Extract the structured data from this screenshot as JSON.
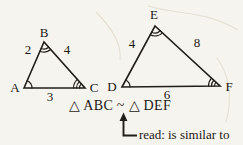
{
  "diagram": {
    "triangle_abc": {
      "vertex_a": "A",
      "vertex_b": "B",
      "vertex_c": "C",
      "side_ab": "2",
      "side_bc": "4",
      "side_ac": "3",
      "angle_marks": {
        "a": 1,
        "b": 2,
        "c": 3
      }
    },
    "triangle_def": {
      "vertex_d": "D",
      "vertex_e": "E",
      "vertex_f": "F",
      "side_de": "4",
      "side_ef": "8",
      "side_df": "6",
      "angle_marks": {
        "d": 1,
        "e": 2,
        "f": 3
      }
    },
    "similarity_statement": "△ ABC ~ △ DEF",
    "annotation": {
      "label": "read:",
      "text": "is similar to"
    },
    "colors": {
      "ink": "#211e1a",
      "paper": "#f6f4ee"
    }
  }
}
